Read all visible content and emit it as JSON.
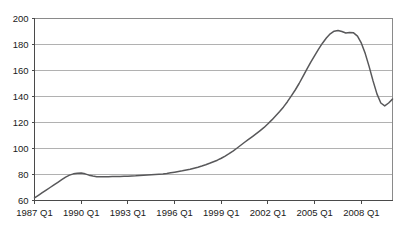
{
  "chart_data": {
    "type": "line",
    "title": "",
    "subtitle": "",
    "xlabel": "",
    "ylabel": "",
    "grid": true,
    "legend": false,
    "legend_position": "none",
    "line_color": "#58585a",
    "background_color": "#ffffff",
    "gridline_color": "#a8a8a8",
    "axis_color": "#4a4a4a",
    "ylim": [
      60,
      200
    ],
    "y_ticks": [
      60,
      80,
      100,
      120,
      140,
      160,
      180,
      200
    ],
    "y_tick_labels": [
      "60",
      "80",
      "100",
      "120",
      "140",
      "160",
      "180",
      "200"
    ],
    "x_tick_labels": [
      "1987 Q1",
      "1990 Q1",
      "1993 Q1",
      "1996 Q1",
      "1999 Q1",
      "2002 Q1",
      "2005 Q1",
      "2008 Q1"
    ],
    "x_tick_indices": [
      0,
      12,
      24,
      36,
      48,
      60,
      72,
      84
    ],
    "x_label_interval_quarters": 12,
    "xlim_indices": [
      0,
      92
    ],
    "x": [
      "1987 Q1",
      "1987 Q2",
      "1987 Q3",
      "1987 Q4",
      "1988 Q1",
      "1988 Q2",
      "1988 Q3",
      "1988 Q4",
      "1989 Q1",
      "1989 Q2",
      "1989 Q3",
      "1989 Q4",
      "1990 Q1",
      "1990 Q2",
      "1990 Q3",
      "1990 Q4",
      "1991 Q1",
      "1991 Q2",
      "1991 Q3",
      "1991 Q4",
      "1992 Q1",
      "1992 Q2",
      "1992 Q3",
      "1992 Q4",
      "1993 Q1",
      "1993 Q2",
      "1993 Q3",
      "1993 Q4",
      "1994 Q1",
      "1994 Q2",
      "1994 Q3",
      "1994 Q4",
      "1995 Q1",
      "1995 Q2",
      "1995 Q3",
      "1995 Q4",
      "1996 Q1",
      "1996 Q2",
      "1996 Q3",
      "1996 Q4",
      "1997 Q1",
      "1997 Q2",
      "1997 Q3",
      "1997 Q4",
      "1998 Q1",
      "1998 Q2",
      "1998 Q3",
      "1998 Q4",
      "1999 Q1",
      "1999 Q2",
      "1999 Q3",
      "1999 Q4",
      "2000 Q1",
      "2000 Q2",
      "2000 Q3",
      "2000 Q4",
      "2001 Q1",
      "2001 Q2",
      "2001 Q3",
      "2001 Q4",
      "2002 Q1",
      "2002 Q2",
      "2002 Q3",
      "2002 Q4",
      "2003 Q1",
      "2003 Q2",
      "2003 Q3",
      "2003 Q4",
      "2004 Q1",
      "2004 Q2",
      "2004 Q3",
      "2004 Q4",
      "2005 Q1",
      "2005 Q2",
      "2005 Q3",
      "2005 Q4",
      "2006 Q1",
      "2006 Q2",
      "2006 Q3",
      "2006 Q4",
      "2007 Q1",
      "2007 Q2",
      "2007 Q3",
      "2007 Q4",
      "2008 Q1",
      "2008 Q2",
      "2008 Q3",
      "2008 Q4",
      "2009 Q1",
      "2009 Q2",
      "2009 Q3",
      "2009 Q4",
      "2010 Q1"
    ],
    "values": [
      62.0,
      64.0,
      66.0,
      68.0,
      70.0,
      72.0,
      74.0,
      76.0,
      78.0,
      79.5,
      80.5,
      81.0,
      81.2,
      80.5,
      79.5,
      78.8,
      78.3,
      78.2,
      78.3,
      78.3,
      78.4,
      78.5,
      78.5,
      78.6,
      78.7,
      78.9,
      79.0,
      79.2,
      79.4,
      79.6,
      79.8,
      80.0,
      80.2,
      80.4,
      80.8,
      81.3,
      81.8,
      82.3,
      82.8,
      83.4,
      84.0,
      84.8,
      85.6,
      86.5,
      87.5,
      88.6,
      89.8,
      91.0,
      92.5,
      94.2,
      96.0,
      98.0,
      100.2,
      102.5,
      104.8,
      107.0,
      109.2,
      111.5,
      113.8,
      116.2,
      119.0,
      122.0,
      125.2,
      128.5,
      132.0,
      136.0,
      140.5,
      145.0,
      150.0,
      155.5,
      161.0,
      166.5,
      171.5,
      176.5,
      181.0,
      185.0,
      188.2,
      190.2,
      190.8,
      190.0,
      188.8,
      189.2,
      189.0,
      186.5,
      181.0,
      173.0,
      163.0,
      152.0,
      142.0,
      135.0,
      132.8,
      135.0,
      138.0
    ]
  }
}
